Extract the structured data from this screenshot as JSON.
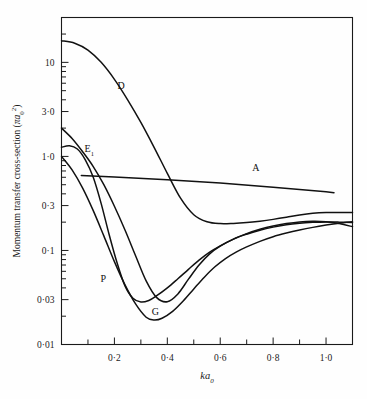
{
  "chart_data": {
    "type": "line",
    "title": "",
    "xlabel": "ka₀",
    "ylabel": "Momentum transfer cross-section (πa₀²)",
    "xscale": "linear",
    "yscale": "log",
    "xlim": [
      0.0,
      1.1
    ],
    "ylim": [
      0.01,
      30
    ],
    "grid": false,
    "legend_position": "inline-curve-labels",
    "x_ticks_major": [
      0.2,
      0.4,
      0.6,
      0.8,
      1.0
    ],
    "x_tick_labels": [
      "0·2",
      "0·4",
      "0·6",
      "0·8",
      "1·0"
    ],
    "x_ticks_minor": [
      0.1,
      0.3,
      0.5,
      0.7,
      0.9,
      1.1
    ],
    "y_ticks_major": [
      0.01,
      0.03,
      0.1,
      0.3,
      1.0,
      3.0,
      10.0
    ],
    "y_tick_labels": [
      "0·01",
      "0·03",
      "0·1",
      "0·3",
      "1·0",
      "3·0",
      "10"
    ],
    "series": [
      {
        "name": "D",
        "label": "D",
        "label_x": 0.225,
        "label_y": 5.2,
        "x": [
          0.0,
          0.05,
          0.1,
          0.15,
          0.2,
          0.25,
          0.3,
          0.35,
          0.4,
          0.45,
          0.5,
          0.55,
          0.6,
          0.65,
          0.7,
          0.75,
          0.8,
          0.85,
          0.9,
          0.95,
          1.0,
          1.05,
          1.1
        ],
        "y": [
          17.0,
          16.0,
          13.5,
          10.0,
          6.6,
          4.0,
          2.3,
          1.25,
          0.66,
          0.36,
          0.24,
          0.202,
          0.193,
          0.194,
          0.198,
          0.205,
          0.214,
          0.225,
          0.238,
          0.248,
          0.253,
          0.254,
          0.253
        ]
      },
      {
        "name": "E1",
        "label": "E",
        "label_sub": "1",
        "label_x": 0.105,
        "label_y": 1.12,
        "x": [
          0.0,
          0.04,
          0.08,
          0.12,
          0.16,
          0.2,
          0.24,
          0.28,
          0.32,
          0.36,
          0.4,
          0.44,
          0.48,
          0.52,
          0.56,
          0.6,
          0.65,
          0.7,
          0.75,
          0.8,
          0.85,
          0.9,
          0.95,
          1.0,
          1.05,
          1.1
        ],
        "y": [
          2.0,
          1.55,
          1.12,
          0.78,
          0.5,
          0.295,
          0.165,
          0.088,
          0.0475,
          0.0315,
          0.0285,
          0.0345,
          0.0495,
          0.07,
          0.092,
          0.111,
          0.132,
          0.149,
          0.164,
          0.177,
          0.188,
          0.195,
          0.199,
          0.201,
          0.2,
          0.198
        ]
      },
      {
        "name": "P",
        "label": "P",
        "label_x": 0.158,
        "label_y": 0.0465,
        "x": [
          0.0,
          0.03,
          0.06,
          0.09,
          0.12,
          0.15,
          0.18,
          0.21,
          0.24,
          0.27,
          0.3,
          0.33,
          0.36,
          0.4,
          0.44,
          0.48,
          0.52,
          0.56,
          0.6,
          0.65,
          0.7,
          0.75,
          0.8,
          0.85,
          0.9,
          0.95,
          1.0,
          1.05,
          1.1
        ],
        "y": [
          1.25,
          1.3,
          1.2,
          0.92,
          0.6,
          0.315,
          0.148,
          0.074,
          0.042,
          0.031,
          0.0283,
          0.0294,
          0.033,
          0.04,
          0.05,
          0.063,
          0.079,
          0.096,
          0.112,
          0.132,
          0.151,
          0.168,
          0.182,
          0.193,
          0.201,
          0.204,
          0.202,
          0.193,
          0.179
        ]
      },
      {
        "name": "G",
        "label": "G",
        "label_x": 0.355,
        "label_y": 0.0205,
        "x": [
          0.0,
          0.04,
          0.08,
          0.12,
          0.16,
          0.2,
          0.24,
          0.28,
          0.32,
          0.35,
          0.38,
          0.42,
          0.46,
          0.5,
          0.54,
          0.58,
          0.62,
          0.66,
          0.7,
          0.75,
          0.8,
          0.85,
          0.9,
          0.95,
          1.0,
          1.05,
          1.1
        ],
        "y": [
          1.0,
          0.72,
          0.46,
          0.265,
          0.143,
          0.076,
          0.043,
          0.027,
          0.0195,
          0.0182,
          0.019,
          0.0225,
          0.029,
          0.039,
          0.052,
          0.067,
          0.082,
          0.096,
          0.109,
          0.125,
          0.14,
          0.153,
          0.165,
          0.176,
          0.186,
          0.195,
          0.202
        ]
      },
      {
        "name": "A",
        "label": "A",
        "label_x": 0.735,
        "label_y": 0.705,
        "x": [
          0.075,
          0.2,
          0.4,
          0.6,
          0.8,
          1.0,
          1.03
        ],
        "y": [
          0.625,
          0.605,
          0.565,
          0.52,
          0.47,
          0.42,
          0.412
        ]
      }
    ]
  },
  "axis_labels": {
    "y_title": "Momentum transfer cross-section (πa₀²)",
    "y_title_main": "Momentum transfer cross-section (",
    "y_title_pi_a": "πa",
    "y_title_sub": "0",
    "y_title_sup": "2",
    "y_title_close": ")",
    "x_title_main": "ka",
    "x_title_sub": "0"
  },
  "colors": {
    "curve": "#111111",
    "axis": "#1a1a1a",
    "background": "#fefefe"
  }
}
